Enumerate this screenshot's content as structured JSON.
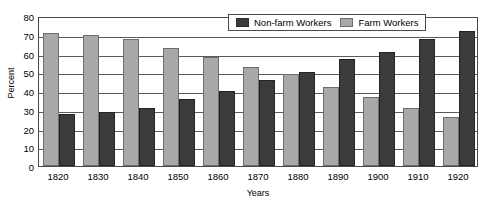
{
  "chart_data": {
    "type": "bar",
    "title": "",
    "xlabel": "Years",
    "ylabel": "Percent",
    "ylim": [
      0,
      80
    ],
    "yticks": [
      0,
      10,
      20,
      30,
      40,
      50,
      60,
      70,
      80
    ],
    "grid": true,
    "legend_position": "top-right",
    "categories": [
      "1820",
      "1830",
      "1840",
      "1850",
      "1860",
      "1870",
      "1880",
      "1890",
      "1900",
      "1910",
      "1920"
    ],
    "series": [
      {
        "name": "Farm Workers",
        "color": "#a8a8a8",
        "values": [
          71,
          70,
          68,
          63,
          58,
          53,
          49,
          42,
          37,
          31,
          26
        ]
      },
      {
        "name": "Non-farm Workers",
        "color": "#3b3b3b",
        "values": [
          28,
          29,
          31,
          36,
          40,
          46,
          50,
          57,
          61,
          68,
          72
        ]
      }
    ],
    "series_draw_order": [
      "Farm Workers",
      "Non-farm Workers"
    ]
  },
  "legend": {
    "entries": [
      {
        "label": "Non-farm Workers",
        "swatch": "nonfarm"
      },
      {
        "label": "Farm Workers",
        "swatch": "farm"
      }
    ]
  }
}
